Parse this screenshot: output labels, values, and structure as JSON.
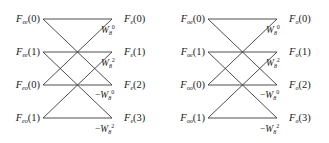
{
  "figure": {
    "type": "fft-butterfly-diagram",
    "line_color": "#3a3a3a",
    "background_color": "#ffffff",
    "rows": 4,
    "row_y": [
      19,
      52,
      85,
      118
    ],
    "node_x_left": 43,
    "node_x_right": 112
  },
  "panels": [
    {
      "id": "left",
      "name": "even-part-butterfly",
      "inputs": [
        {
          "base": "F",
          "sub": "ee",
          "index": "(0)"
        },
        {
          "base": "F",
          "sub": "ee",
          "index": "(1)"
        },
        {
          "base": "F",
          "sub": "eo",
          "index": "(0)"
        },
        {
          "base": "F",
          "sub": "eo",
          "index": "(1)"
        }
      ],
      "twiddles": [
        {
          "sign": "",
          "base": "W",
          "sub": "8",
          "sup": "0"
        },
        {
          "sign": "",
          "base": "W",
          "sub": "8",
          "sup": "2"
        },
        {
          "sign": "−",
          "base": "W",
          "sub": "8",
          "sup": "0"
        },
        {
          "sign": "−",
          "base": "W",
          "sub": "8",
          "sup": "2"
        }
      ],
      "outputs": [
        {
          "base": "F",
          "sub": "e",
          "index": "(0)"
        },
        {
          "base": "F",
          "sub": "e",
          "index": "(1)"
        },
        {
          "base": "F",
          "sub": "e",
          "index": "(2)"
        },
        {
          "base": "F",
          "sub": "e",
          "index": "(3)"
        }
      ]
    },
    {
      "id": "right",
      "name": "odd-part-butterfly",
      "inputs": [
        {
          "base": "F",
          "sub": "oe",
          "index": "(0)"
        },
        {
          "base": "F",
          "sub": "oe",
          "index": "(1)"
        },
        {
          "base": "F",
          "sub": "oo",
          "index": "(0)"
        },
        {
          "base": "F",
          "sub": "oo",
          "index": "(1)"
        }
      ],
      "twiddles": [
        {
          "sign": "",
          "base": "W",
          "sub": "8",
          "sup": "0"
        },
        {
          "sign": "",
          "base": "W",
          "sub": "8",
          "sup": "2"
        },
        {
          "sign": "−",
          "base": "W",
          "sub": "8",
          "sup": "0"
        },
        {
          "sign": "−",
          "base": "W",
          "sub": "8",
          "sup": "2"
        }
      ],
      "outputs": [
        {
          "base": "F",
          "sub": "o",
          "index": "(0)"
        },
        {
          "base": "F",
          "sub": "o",
          "index": "(1)"
        },
        {
          "base": "F",
          "sub": "o",
          "index": "(2)"
        },
        {
          "base": "F",
          "sub": "o",
          "index": "(3)"
        }
      ]
    }
  ]
}
